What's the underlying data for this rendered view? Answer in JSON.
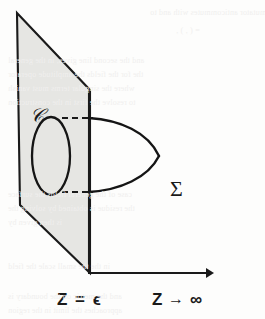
{
  "figure": {
    "kind": "geometry-diagram",
    "colors": {
      "ink": "#1a1a1a",
      "plane_fill": "#e6e6e3",
      "background": "#fdfdfc",
      "bleed": "#f0efee"
    },
    "labels": {
      "curve": "C",
      "curve_script": "𝒞",
      "surface": "Σ",
      "axis_left": "Z = ϵ",
      "axis_right_var": "Z",
      "axis_right_arrow": "→",
      "axis_right_limit": "∞"
    },
    "geometry": {
      "plane_points": "17,13 90,90 90,273 20,205",
      "plane_vertical_edge": {
        "x": 89,
        "y1": 90,
        "y2": 273
      },
      "ellipse": {
        "cx": 51,
        "cy": 156,
        "rx": 19,
        "ry": 39
      },
      "axis": {
        "x1": 88,
        "y1": 273,
        "x2": 212,
        "y2": 273
      },
      "sigma_top": "M 89,118 C 118,120 146,133 158,156",
      "sigma_bottom": "M 89,192 C 118,190 146,178 158,156",
      "dash_top": {
        "x1": 62,
        "y1": 118,
        "x2": 92,
        "y2": 118
      },
      "dash_bottom": {
        "x1": 62,
        "y1": 192,
        "x2": 92,
        "y2": 192
      }
    }
  },
  "bleed_lines": [
    {
      "text": "the commutator anticommutes with and to",
      "x": 150,
      "y": 8
    },
    {
      "text": "= ( , ) ,",
      "x": 176,
      "y": 26
    },
    {
      "text": "and the second line gives, in the general",
      "x": 8,
      "y": 56
    },
    {
      "text": "the for the fields the amplitude operator",
      "x": 8,
      "y": 70
    },
    {
      "text": "where the singular terms must vanish",
      "x": 8,
      "y": 84
    },
    {
      "text": "to resolve the first in the construction",
      "x": 8,
      "y": 98
    },
    {
      "text": "case of the general fields the surface",
      "x": 8,
      "y": 190
    },
    {
      "text": "the residue is obtained by solving the",
      "x": 8,
      "y": 204
    },
    {
      "text": "is then given by",
      "x": 8,
      "y": 218
    },
    {
      "text": "in the the small scale the field",
      "x": 8,
      "y": 262
    },
    {
      "text": "and the metric on the boundary is",
      "x": 8,
      "y": 292
    },
    {
      "text": "approaches the limit in the region",
      "x": 8,
      "y": 306
    }
  ]
}
